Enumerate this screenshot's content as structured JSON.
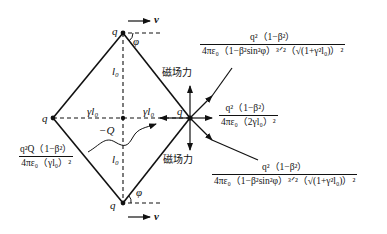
{
  "diagram": {
    "charges": {
      "top": "q",
      "left": "q",
      "right": "q",
      "bottom": "q",
      "center": "−Q"
    },
    "velocity_label": "v",
    "angle_label": "φ",
    "distances": {
      "vertical_top": "l₀",
      "vertical_bottom": "l₀",
      "horizontal_left": "γl₀",
      "horizontal_right": "γl₀"
    },
    "magnetic_force_label": "磁场力",
    "formulas": {
      "top_right": {
        "numerator": "q²（1−β²）",
        "denominator": "4πε₀（1−β²sin²φ）³ᐟ²（√(1+γ²l₀)）²"
      },
      "middle_right": {
        "numerator": "q²（1−β²）",
        "denominator": "4πε₀（2γl₀）²"
      },
      "bottom_right": {
        "numerator": "q²（1−β²）",
        "denominator": "4πε₀（1−β²sin²φ）³ᐟ²（√(1+γ²l₀)）²"
      },
      "left_center": {
        "numerator": "q²Q（1−β²）",
        "denominator": "4πε₀（γl₀）²"
      }
    },
    "colors": {
      "line": "#111111",
      "background": "#ffffff"
    }
  }
}
